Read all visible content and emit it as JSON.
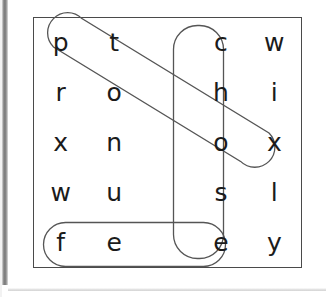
{
  "puzzle": {
    "type": "word-search",
    "rows": 5,
    "cols": 5,
    "grid": [
      [
        "p",
        "t",
        "",
        "c",
        "w"
      ],
      [
        "r",
        "o",
        "",
        "h",
        "i"
      ],
      [
        "x",
        "n",
        "",
        "o",
        "x"
      ],
      [
        "w",
        "u",
        "",
        "s",
        "l"
      ],
      [
        "f",
        "e",
        "",
        "e",
        "y"
      ]
    ],
    "found_words": [
      {
        "word": "pool",
        "orientation": "diagonal-down-right",
        "start": {
          "row": 0,
          "col": 0
        },
        "end": {
          "row": 3,
          "col": 4
        },
        "letters": [
          "p",
          "o",
          "o",
          "l"
        ],
        "loop_color": "#555555"
      },
      {
        "word": "chose",
        "orientation": "vertical-down",
        "start": {
          "row": 0,
          "col": 3
        },
        "end": {
          "row": 4,
          "col": 3
        },
        "letters": [
          "c",
          "h",
          "o",
          "s",
          "e"
        ],
        "loop_color": "#555555"
      },
      {
        "word": "fee",
        "orientation": "horizontal-right",
        "start": {
          "row": 4,
          "col": 0
        },
        "end": {
          "row": 4,
          "col": 3
        },
        "letters": [
          "f",
          "e",
          "e"
        ],
        "loop_color": "#555555"
      }
    ]
  },
  "frame": {
    "border_color": "#4a4a4a",
    "background_color": "#ffffff"
  },
  "scan_artifact": {
    "edge_strip_color": "#6e6e6e",
    "bottom_rule_color": "#cfcfcf"
  }
}
